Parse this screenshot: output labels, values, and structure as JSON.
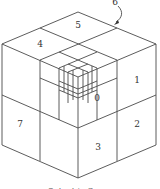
{
  "diagram": {
    "type": "octree-subdivision-cube",
    "octant_labels": {
      "o0": "0",
      "o1": "1",
      "o2": "2",
      "o3": "3",
      "o4": "4",
      "o5": "5",
      "o6": "6",
      "o7": "7"
    },
    "caption": "Octant in Space",
    "colors": {
      "stroke": "#4a4a4a",
      "text": "#333333",
      "background": "#ffffff"
    }
  }
}
